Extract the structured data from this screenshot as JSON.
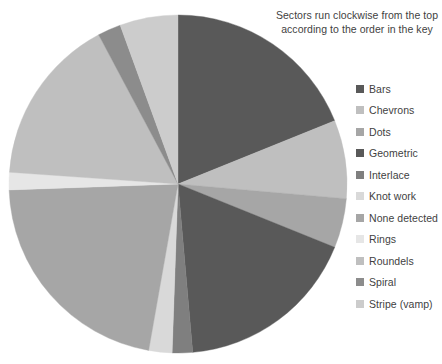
{
  "annotation": {
    "line1": "Sectors run clockwise from the top",
    "line2": "according to the order in the key"
  },
  "legend": {
    "position": "right",
    "items": [
      {
        "label": "Bars",
        "color": "#595959"
      },
      {
        "label": "Chevrons",
        "color": "#bfbfbf"
      },
      {
        "label": "Dots",
        "color": "#a6a6a6"
      },
      {
        "label": "Geometric",
        "color": "#595959"
      },
      {
        "label": "Interlace",
        "color": "#7f7f7f"
      },
      {
        "label": "Knot work",
        "color": "#d9d9d9"
      },
      {
        "label": "None detected",
        "color": "#a6a6a6"
      },
      {
        "label": "Rings",
        "color": "#e6e6e6"
      },
      {
        "label": "Roundels",
        "color": "#bfbfbf"
      },
      {
        "label": "Spiral",
        "color": "#8c8c8c"
      },
      {
        "label": "Stripe (vamp)",
        "color": "#cccccc"
      }
    ]
  },
  "chart_data": {
    "type": "pie",
    "title": "",
    "subtitle": "",
    "xlabel": "",
    "ylabel": "",
    "grid": false,
    "legend_position": "right",
    "start_angle_deg": 0,
    "direction": "clockwise",
    "center": {
      "x": 178,
      "y": 184
    },
    "radius": 169,
    "categories": [
      "Bars",
      "Chevrons",
      "Dots",
      "Geometric",
      "Interlace",
      "Knot work",
      "None detected",
      "Rings",
      "Roundels",
      "Spiral",
      "Stripe (vamp)"
    ],
    "values": [
      18.9,
      7.5,
      4.7,
      17.5,
      1.9,
      2.2,
      21.7,
      1.7,
      16.1,
      2.2,
      5.6
    ],
    "units": "percent",
    "angles_deg": [
      68,
      27,
      17,
      63,
      7,
      8,
      78,
      6,
      58,
      8,
      20
    ],
    "colors": [
      "#595959",
      "#bfbfbf",
      "#a6a6a6",
      "#595959",
      "#7f7f7f",
      "#d9d9d9",
      "#a6a6a6",
      "#e6e6e6",
      "#bfbfbf",
      "#8c8c8c",
      "#cccccc"
    ],
    "annotation": "Sectors run clockwise from the top according to the order in the key"
  }
}
